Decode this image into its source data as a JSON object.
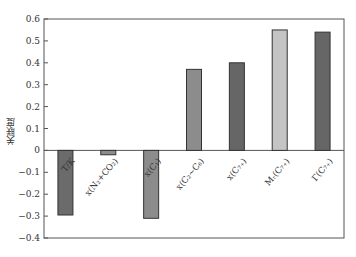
{
  "chart_data": {
    "type": "bar",
    "title": "",
    "xlabel": "",
    "ylabel": "关联度",
    "ylim": [
      -0.4,
      0.6
    ],
    "yticks": [
      0.6,
      0.5,
      0.4,
      0.3,
      0.2,
      0.1,
      0,
      -0.1,
      -0.2,
      -0.3,
      -0.4
    ],
    "ytick_labels": [
      "0.6",
      "0.5",
      "0.4",
      "0.3",
      "0.2",
      "0.1",
      "0",
      "−0.1",
      "−0.2",
      "−0.3",
      "−0.4"
    ],
    "grid": false,
    "legend": null,
    "categories": [
      "T/K",
      "x(N₂+CO₂)",
      "x(C₁)",
      "x(C₂~C₆)",
      "x(C₇₊)",
      "Mᵣ(C₇₊)",
      "Γ(C₇₊)"
    ],
    "values": [
      -0.295,
      -0.02,
      -0.31,
      0.37,
      0.4,
      0.55,
      0.54
    ],
    "bar_colors": [
      "#6b6b6b",
      "#8c8c8c",
      "#8c8c8c",
      "#8c8c8c",
      "#666666",
      "#c4c4c4",
      "#666666"
    ]
  }
}
